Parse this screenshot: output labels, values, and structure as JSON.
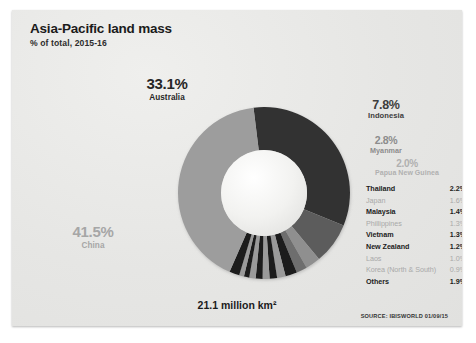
{
  "header": {
    "title": "Asia-Pacific land mass",
    "subtitle": "% of total, 2015-16"
  },
  "footer": {
    "total": "21.1 million km²",
    "source": "SOURCE: IBISWORLD 01/09/15"
  },
  "callouts": {
    "australia": {
      "pct": "33.1%",
      "name": "Australia"
    },
    "china": {
      "pct": "41.5%",
      "name": "China"
    },
    "indonesia": {
      "pct": "7.8%",
      "name": "Indonesia"
    },
    "myanmar": {
      "pct": "2.8%",
      "name": "Myanmar"
    },
    "png": {
      "pct": "2.0%",
      "name": "Papua New Guinea"
    }
  },
  "legend": [
    {
      "name": "Thailand",
      "value": "2.2%",
      "emphasis": "dark"
    },
    {
      "name": "Japan",
      "value": "1.6%",
      "emphasis": "light"
    },
    {
      "name": "Malaysia",
      "value": "1.4%",
      "emphasis": "dark"
    },
    {
      "name": "Phillippines",
      "value": "1.3%",
      "emphasis": "light"
    },
    {
      "name": "Vietnam",
      "value": "1.3%",
      "emphasis": "dark"
    },
    {
      "name": "New Zealand",
      "value": "1.2%",
      "emphasis": "dark"
    },
    {
      "name": "Laos",
      "value": "1.0%",
      "emphasis": "light"
    },
    {
      "name": "Korea (North & South)",
      "value": "0.9%",
      "emphasis": "light"
    },
    {
      "name": "Others",
      "value": "1.9%",
      "emphasis": "dark"
    }
  ],
  "chart_data": {
    "type": "pie",
    "variant": "donut",
    "title": "Asia-Pacific land mass",
    "subtitle": "% of total, 2015-16",
    "unit": "% of total land mass",
    "total_label": "21.1 million km²",
    "start_angle_deg": -7,
    "direction": "clockwise",
    "outer_radius": 86,
    "inner_radius": 43,
    "labels": [
      "Australia",
      "Indonesia",
      "Myanmar",
      "Papua New Guinea",
      "Thailand",
      "Japan",
      "Malaysia",
      "Phillippines",
      "Vietnam",
      "New Zealand",
      "Laos",
      "Korea (North & South)",
      "Others",
      "China"
    ],
    "values": [
      33.1,
      7.8,
      2.8,
      2.0,
      2.2,
      1.6,
      1.4,
      1.3,
      1.3,
      1.2,
      1.0,
      0.9,
      1.9,
      41.5
    ],
    "colors": [
      "#333333",
      "#5c5c5c",
      "#8f8f8f",
      "#6e6e6e",
      "#1e1e1e",
      "#9a9a9a",
      "#1e1e1e",
      "#9a9a9a",
      "#1e1e1e",
      "#9a9a9a",
      "#1e1e1e",
      "#9a9a9a",
      "#1e1e1e",
      "#9d9d9d"
    ],
    "legend_position": "right",
    "grid": false
  },
  "palette": {
    "card_bg": "#e9e9e7",
    "ink": "#1b1b1b",
    "muted": "#a9a9a9",
    "australia": "#333333",
    "china": "#9d9d9d",
    "indonesia": "#5c5c5c"
  }
}
